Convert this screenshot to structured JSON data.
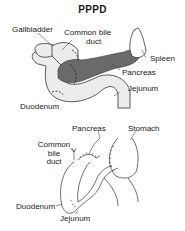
{
  "title": "PPPD",
  "top_diagram": {
    "labels": {
      "gallbladder": "Gallbladder",
      "common_bile_duct_1": "Common bile",
      "common_bile_duct_2": "duct",
      "spleen": "Spleen",
      "pancreas": "Pancreas",
      "jejunum": "Jejunum",
      "duodenum": "Duodenum"
    }
  },
  "bottom_diagram": {
    "labels": {
      "pancreas": "Pancreas",
      "stomach": "Stomach",
      "common_1": "Common",
      "common_2": "bile",
      "common_3": "duct",
      "duodenum": "Duodenum",
      "jejunum": "Jejunum"
    }
  },
  "colors": {
    "organ_fill": "#ececec",
    "pancreas_fill": "#6a6a6a",
    "outline": "#333333"
  }
}
